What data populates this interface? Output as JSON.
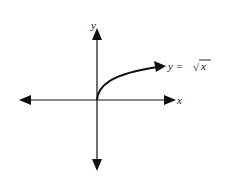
{
  "diagram": {
    "type": "function-graph",
    "axes": {
      "x_label": "x",
      "y_label": "y"
    },
    "curve": {
      "function": "sqrt",
      "label_prefix": "y = ",
      "label_radical": "√",
      "label_arg": "x",
      "label_full": "y = √x"
    },
    "colors": {
      "stroke": "#111111",
      "background": "#ffffff"
    }
  }
}
